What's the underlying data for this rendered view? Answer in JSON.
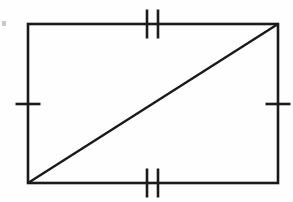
{
  "figure": {
    "title": "Rectangle with one diagonal and congruence tick marks",
    "background_color": "#fefefe",
    "ink_color": "#1a1a1a",
    "canvas": {
      "width": 293,
      "height": 202
    },
    "rectangle": {
      "label": "rectangle",
      "stroke_color": "#1a1a1a",
      "stroke_width": 2.6,
      "fill": "none",
      "left": 28,
      "top": 24,
      "right": 278,
      "bottom": 183,
      "width": 250,
      "height": 159,
      "vertices": [
        {
          "name": "top-left",
          "x": 28,
          "y": 24
        },
        {
          "name": "top-right",
          "x": 278,
          "y": 24
        },
        {
          "name": "bottom-right",
          "x": 278,
          "y": 183
        },
        {
          "name": "bottom-left",
          "x": 28,
          "y": 183
        }
      ]
    },
    "diagonal": {
      "label": "diagonal",
      "stroke_color": "#1a1a1a",
      "stroke_width": 2.4,
      "from": {
        "name": "bottom-left",
        "x": 28,
        "y": 183
      },
      "to": {
        "name": "top-right",
        "x": 278,
        "y": 24
      }
    },
    "tick_marks": [
      {
        "name": "top-side-double-tick",
        "side": "top",
        "count": 2,
        "orientation": "vertical",
        "stroke_color": "#1a1a1a",
        "stroke_width": 2.6,
        "length": 29,
        "center_y": 24,
        "positions_x": [
          147,
          158
        ]
      },
      {
        "name": "bottom-side-double-tick",
        "side": "bottom",
        "count": 2,
        "orientation": "vertical",
        "stroke_color": "#1a1a1a",
        "stroke_width": 2.6,
        "length": 29,
        "center_y": 183,
        "positions_x": [
          147,
          158
        ]
      },
      {
        "name": "left-side-single-tick",
        "side": "left",
        "count": 1,
        "orientation": "horizontal",
        "stroke_color": "#1a1a1a",
        "stroke_width": 2.6,
        "length": 25,
        "center_x": 28,
        "positions_y": [
          104
        ]
      },
      {
        "name": "right-side-single-tick",
        "side": "right",
        "count": 1,
        "orientation": "horizontal",
        "stroke_color": "#1a1a1a",
        "stroke_width": 2.6,
        "length": 25,
        "center_x": 278,
        "positions_y": [
          104
        ]
      }
    ],
    "artifacts": [
      {
        "name": "scan-speck-left-margin",
        "x": 2,
        "y": 21,
        "width": 4,
        "height": 5,
        "color": "#c9c9c9"
      }
    ]
  }
}
